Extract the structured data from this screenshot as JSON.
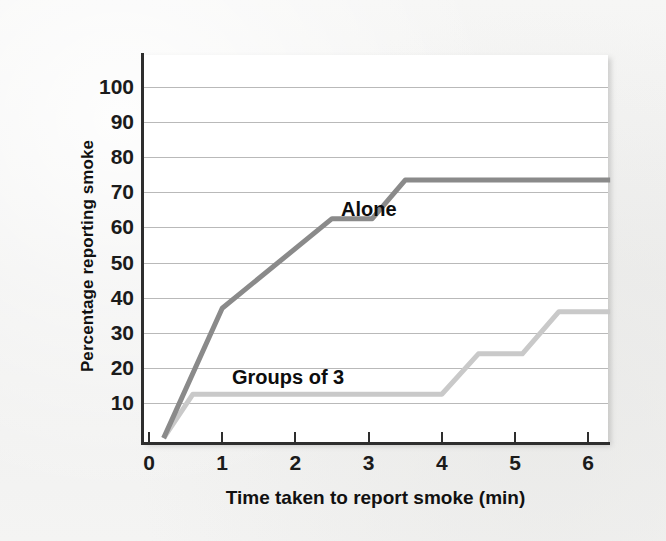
{
  "figure": {
    "background_color": "#f3f3f2",
    "plot_background_color": "#ffffff",
    "axis_color": "#2e2e2e",
    "gridline_color": "#b9b9b9"
  },
  "axes": {
    "y_title": "Percentage reporting smoke",
    "x_title": "Time taken to report smoke (min)",
    "y_ticks": [
      10,
      20,
      30,
      40,
      50,
      60,
      70,
      80,
      90,
      100
    ],
    "x_ticks": [
      0,
      1,
      2,
      3,
      4,
      5,
      6
    ],
    "y_tick_labels": [
      "10",
      "20",
      "30",
      "40",
      "50",
      "60",
      "70",
      "80",
      "90",
      "100"
    ],
    "x_tick_labels": [
      "0",
      "1",
      "2",
      "3",
      "4",
      "5",
      "6"
    ]
  },
  "chart_data": {
    "type": "line",
    "title": "",
    "subtitle": "",
    "xlabel": "Time taken to report smoke (min)",
    "ylabel": "Percentage reporting smoke",
    "xlim": [
      0,
      6.35
    ],
    "ylim": [
      0,
      105
    ],
    "grid": true,
    "grid_axis": "y",
    "legend": "inline-annotations",
    "annotations": [
      {
        "text": "Alone",
        "x": 3.55,
        "y": 67
      },
      {
        "text": "Groups of 3",
        "x": 2.1,
        "y": 18
      }
    ],
    "series": [
      {
        "name": "Alone",
        "color": "#8a8a8a",
        "linewidth": 5,
        "x": [
          0.2,
          1.0,
          2.5,
          3.05,
          3.5,
          6.3
        ],
        "y": [
          0,
          37,
          62.5,
          62.5,
          73.5,
          73.5
        ],
        "points": [
          {
            "x": 0.2,
            "y": 0
          },
          {
            "x": 1.0,
            "y": 37
          },
          {
            "x": 2.5,
            "y": 62.5
          },
          {
            "x": 3.05,
            "y": 62.5
          },
          {
            "x": 3.5,
            "y": 73.5
          },
          {
            "x": 6.3,
            "y": 73.5
          }
        ]
      },
      {
        "name": "Groups of 3",
        "color": "#c9c9c9",
        "linewidth": 5,
        "x": [
          0.2,
          0.6,
          4.0,
          4.5,
          5.1,
          5.6,
          6.3
        ],
        "y": [
          0,
          12.5,
          12.5,
          24,
          24,
          36,
          36
        ],
        "points": [
          {
            "x": 0.2,
            "y": 0
          },
          {
            "x": 0.6,
            "y": 12.5
          },
          {
            "x": 4.0,
            "y": 12.5
          },
          {
            "x": 4.5,
            "y": 24
          },
          {
            "x": 5.1,
            "y": 24
          },
          {
            "x": 5.6,
            "y": 36
          },
          {
            "x": 6.3,
            "y": 36
          }
        ]
      }
    ]
  },
  "labels": {
    "alone": "Alone",
    "groups_of_3": "Groups of 3"
  }
}
